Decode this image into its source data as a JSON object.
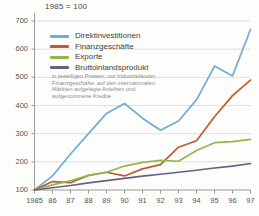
{
  "header": {
    "index_note": "1985 = 100"
  },
  "footnote": "in jeweiligen Preisen; nur Industrieländer; Finanzgeschäfte: auf den internationalen Märkten aufgelegte Anleihen und aufgenommene Kredite",
  "colors": {
    "direktinvestitionen": "#6FACD6",
    "finanzgeschaefte": "#BE5B33",
    "exporte": "#8FB94F",
    "bruttoinlandsprodukt": "#6B5E86",
    "grid": "#d8d8d8",
    "axis": "#9a9a9a",
    "background": "#fdfdfb"
  },
  "chart_data": {
    "type": "line",
    "title": "1985 = 100",
    "xlabel": "",
    "ylabel": "",
    "xlim": [
      1985,
      1997
    ],
    "ylim": [
      100,
      700
    ],
    "yticks": [
      100,
      200,
      300,
      400,
      500,
      600,
      700
    ],
    "grid": true,
    "legend_position": "top-left",
    "x": [
      1985,
      1986,
      1987,
      1988,
      1989,
      1990,
      1991,
      1992,
      1993,
      1994,
      1995,
      1996,
      1997
    ],
    "xtick_labels": [
      "1985",
      "86",
      "87",
      "88",
      "89",
      "90",
      "91",
      "92",
      "93",
      "94",
      "95",
      "96",
      "97"
    ],
    "series": [
      {
        "name": "Direktinvestitionen",
        "color": "#6FACD6",
        "values": [
          100,
          150,
          228,
          300,
          372,
          407,
          355,
          312,
          345,
          420,
          540,
          505,
          670
        ]
      },
      {
        "name": "Finanzgeschäfte",
        "color": "#BE5B33",
        "values": [
          100,
          130,
          126,
          152,
          163,
          150,
          175,
          190,
          252,
          275,
          360,
          435,
          490
        ]
      },
      {
        "name": "Exporte",
        "color": "#8FB94F",
        "values": [
          100,
          118,
          133,
          152,
          163,
          185,
          198,
          205,
          202,
          240,
          268,
          272,
          280
        ]
      },
      {
        "name": "Bruttoinlandsprodukt",
        "color": "#6B5E86",
        "values": [
          100,
          108,
          116,
          125,
          133,
          141,
          149,
          156,
          163,
          170,
          178,
          185,
          194
        ]
      }
    ],
    "annotations": [
      "in jeweiligen Preisen; nur Industrieländer; Finanzgeschäfte: auf den internationalen Märkten aufgelegte Anleihen und aufgenommene Kredite"
    ]
  }
}
